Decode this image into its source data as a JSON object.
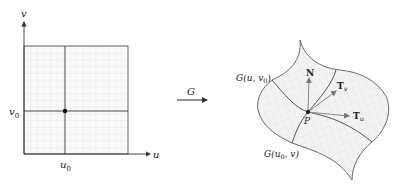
{
  "domain_diagram": {
    "left_panel": {
      "axis_u_label": "u",
      "axis_v_label": "v",
      "tick_u0": "u",
      "tick_u0_sub": "0",
      "tick_v0": "v",
      "tick_v0_sub": "0",
      "point": "(u0, v0)"
    },
    "mapping": {
      "label": "G"
    },
    "right_panel": {
      "curve_u_label": "G(u, v",
      "curve_u_label_sub": "0",
      "curve_u_label_close": ")",
      "curve_v_label": "G(u",
      "curve_v_label_sub": "0",
      "curve_v_label_close": ", v)",
      "normal_label": "N",
      "tangent_v_label": "T",
      "tangent_v_sub": "v",
      "tangent_u_label": "T",
      "tangent_u_sub": "u",
      "point_label": "P"
    },
    "colors": {
      "grid": "#d8d8d8",
      "axis": "#333333",
      "surface_fill": "#f2f2f2",
      "vector": "#888888"
    }
  }
}
